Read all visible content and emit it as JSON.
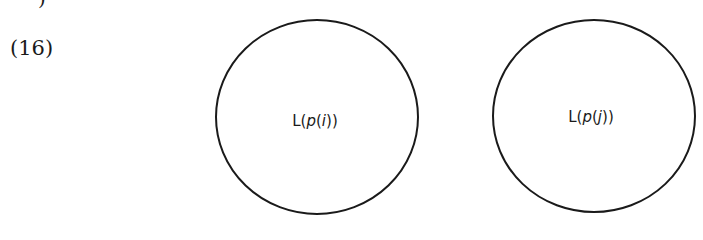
{
  "top_fragment": ")",
  "example_number": "(16)",
  "diagram": {
    "circles": [
      {
        "id": "circle-p-i",
        "cx": 317,
        "cy": 117,
        "rx": 101,
        "ry": 97,
        "label_prefix": "L(",
        "label_var": "p",
        "label_open": "(",
        "label_index": "i",
        "label_close": "))"
      },
      {
        "id": "circle-p-j",
        "cx": 594,
        "cy": 116,
        "rx": 101,
        "ry": 96,
        "label_prefix": "L(",
        "label_var": "p",
        "label_open": "(",
        "label_index": "j",
        "label_close": "))"
      }
    ],
    "stroke_color": "#1a1a1a"
  }
}
